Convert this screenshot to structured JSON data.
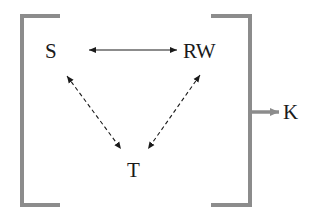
{
  "diagram": {
    "nodes": {
      "s": "S",
      "rw": "RW",
      "t": "T",
      "k": "K"
    },
    "edges": [
      {
        "from": "S",
        "to": "RW",
        "style": "solid",
        "direction": "bidirectional"
      },
      {
        "from": "S",
        "to": "T",
        "style": "dashed",
        "direction": "bidirectional"
      },
      {
        "from": "RW",
        "to": "T",
        "style": "dashed",
        "direction": "bidirectional"
      },
      {
        "from": "bracket-group",
        "to": "K",
        "style": "solid-thick",
        "direction": "forward"
      }
    ],
    "colors": {
      "bracket": "#8c8c8c",
      "arrow": "#1a1a1a",
      "text": "#1a1a1a",
      "output_arrow": "#8c8c8c"
    }
  }
}
